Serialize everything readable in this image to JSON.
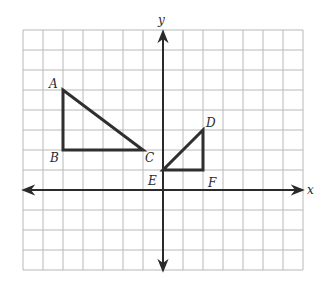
{
  "diagram": {
    "type": "coordinate-plane",
    "axes": {
      "x_label": "x",
      "y_label": "y",
      "x_range": [
        -7,
        7
      ],
      "y_range": [
        -4,
        8
      ],
      "origin_px": [
        163,
        190
      ],
      "unit_px": 20
    },
    "grid": {
      "color": "#b8b8b8",
      "columns": 14,
      "rows": 12
    },
    "colors": {
      "axis": "#2a2a2a",
      "shape_stroke": "#2f2f2f",
      "grid": "#b8b8b8",
      "label": "#2a2a2a"
    },
    "shapes": [
      {
        "name": "triangle-ABC",
        "vertices": [
          {
            "label": "A",
            "x": -5,
            "y": 5
          },
          {
            "label": "B",
            "x": -5,
            "y": 2
          },
          {
            "label": "C",
            "x": -1,
            "y": 2
          }
        ]
      },
      {
        "name": "triangle-DEF",
        "vertices": [
          {
            "label": "D",
            "x": 2,
            "y": 3
          },
          {
            "label": "E",
            "x": 0,
            "y": 1
          },
          {
            "label": "F",
            "x": 2,
            "y": 1
          }
        ]
      }
    ],
    "labels": {
      "A": "A",
      "B": "B",
      "C": "C",
      "D": "D",
      "E": "E",
      "F": "F"
    }
  }
}
